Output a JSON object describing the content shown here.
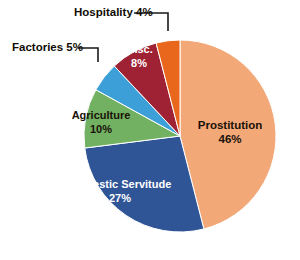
{
  "chart_data": {
    "type": "pie",
    "title": "",
    "subtitle": "",
    "xlabel": "",
    "ylabel": "",
    "legend_position": "none",
    "grid": false,
    "units": "percent",
    "total": 100,
    "start_angle_deg": 0,
    "direction": "clockwise",
    "categories": [
      "Prostitution",
      "Domestic Servitude",
      "Agriculture",
      "Factories",
      "Misc.",
      "Hospitality"
    ],
    "values": [
      46,
      27,
      10,
      5,
      8,
      4
    ],
    "slices": [
      {
        "name": "Prostitution",
        "value": 46,
        "value_label": "46%",
        "color": "#F3A878",
        "label_placement": "inside",
        "label_color": "#1a1208",
        "label_x": 230,
        "label_y": 133
      },
      {
        "name": "Domestic Servitude",
        "value": 27,
        "value_label": "27%",
        "color": "#2F5596",
        "label_placement": "inside",
        "label_color": "#ffffff",
        "label_x": 120,
        "label_y": 190
      },
      {
        "name": "Agriculture",
        "value": 10,
        "value_label": "10%",
        "color": "#72B062",
        "label_placement": "inside",
        "label_color": "#1a1208",
        "label_x": 100,
        "label_y": 121
      },
      {
        "name": "Factories",
        "value": 5,
        "value_label": "5%",
        "color": "#3D9FD8",
        "label_placement": "callout-left",
        "label_color": "#110d06",
        "label_x": 12,
        "label_y": 48
      },
      {
        "name": "Misc.",
        "value": 8,
        "value_label": "8%",
        "color": "#9E2233",
        "label_placement": "inside",
        "label_color": "#ffffff",
        "label_x": 138,
        "label_y": 54
      },
      {
        "name": "Hospitality",
        "value": 4,
        "value_label": "4%",
        "color": "#E8671C",
        "label_placement": "callout-top",
        "label_color": "#110d06",
        "label_x": 74,
        "label_y": 10
      }
    ],
    "geometry": {
      "center_x": 180,
      "center_y": 136,
      "radius": 96
    },
    "background_color": "#FFFFFF"
  },
  "labels": {
    "prostitution_name": "Prostitution",
    "prostitution_value": "46%",
    "domestic_name": "Domestic Servitude",
    "domestic_value": "27%",
    "agriculture_name": "Agriculture",
    "agriculture_value": "10%",
    "misc_name": "Misc.",
    "misc_value": "8%",
    "factories_callout": "Factories 5%",
    "hospitality_callout": "Hospitality 4%"
  }
}
